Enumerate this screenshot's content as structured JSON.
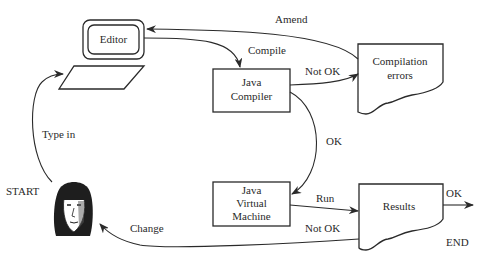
{
  "diagram": {
    "type": "flowchart",
    "nodes": {
      "editor": {
        "label": "Editor"
      },
      "keyboard": {
        "label": ""
      },
      "compiler": {
        "line1": "Java",
        "line2": "Compiler"
      },
      "compilation_errors": {
        "line1": "Compilation",
        "line2": "errors"
      },
      "jvm": {
        "line1": "Java",
        "line2": "Virtual",
        "line3": "Machine"
      },
      "results": {
        "label": "Results"
      },
      "user": {
        "label": "START"
      },
      "end": {
        "label": "END"
      }
    },
    "edges": {
      "type_in": "Type in",
      "compile": "Compile",
      "not_ok_compile": "Not OK",
      "amend": "Amend",
      "ok_compile": "OK",
      "run": "Run",
      "ok_results": "OK",
      "not_ok_results": "Not OK",
      "change": "Change"
    },
    "colors": {
      "stroke": "#2a2a2a",
      "background": "#ffffff"
    }
  }
}
